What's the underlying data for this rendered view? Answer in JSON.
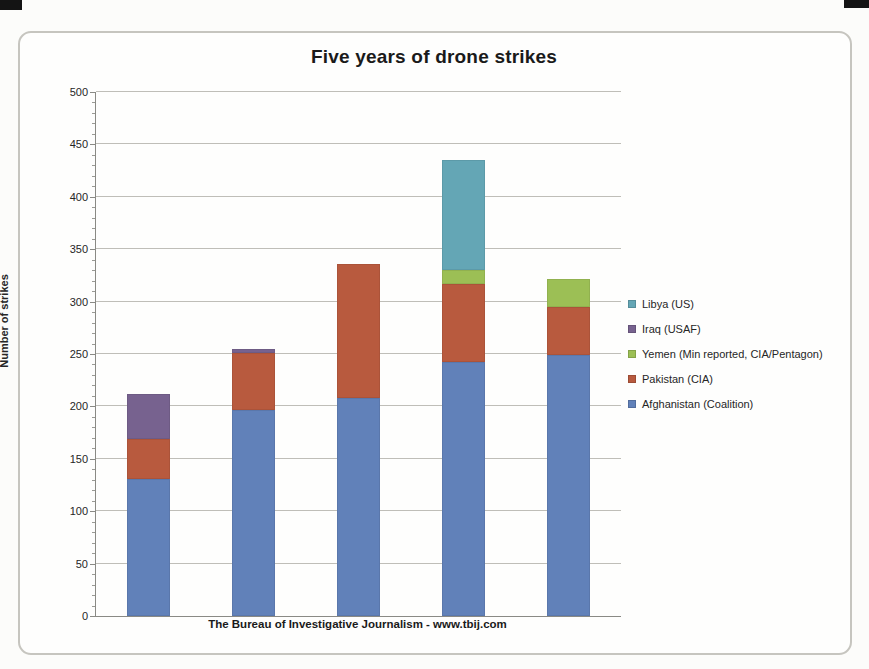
{
  "chart_data": {
    "type": "bar",
    "stacked": true,
    "title": "Five years of drone strikes",
    "ylabel": "Number of strikes",
    "xlabel": "",
    "caption": "The Bureau of Investigative Journalism - www.tbij.com",
    "ylim": [
      0,
      500
    ],
    "ytick_step": 50,
    "ytick_minor_step": 10,
    "grid": "horizontal-major",
    "legend_position": "right",
    "categories": [
      "",
      "",
      "",
      "",
      ""
    ],
    "series": [
      {
        "name": "Afghanistan (Coalition)",
        "color": "#6181b9",
        "values": [
          131,
          197,
          208,
          242,
          249
        ]
      },
      {
        "name": "Pakistan (CIA)",
        "color": "#b85a3e",
        "values": [
          38,
          54,
          128,
          75,
          46
        ]
      },
      {
        "name": "Yemen (Min reported, CIA/Pentagon)",
        "color": "#9cbf55",
        "values": [
          0,
          0,
          0,
          13,
          27
        ]
      },
      {
        "name": "Iraq (USAF)",
        "color": "#77628f",
        "values": [
          43,
          4,
          0,
          0,
          0
        ]
      },
      {
        "name": "Libya (US)",
        "color": "#64a6b5",
        "values": [
          0,
          0,
          0,
          105,
          0
        ]
      }
    ],
    "bar_totals": [
      212,
      255,
      336,
      435,
      322
    ]
  }
}
